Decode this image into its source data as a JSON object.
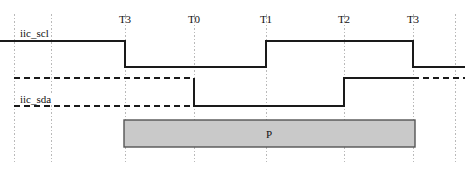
{
  "diagram": {
    "type": "timing-diagram",
    "width": 465,
    "height": 170,
    "background_color": "#ffffff",
    "signal_color": "#1a1a1a",
    "gridline_color": "#b9b9b9",
    "box_fill_color": "#c9c9c9",
    "box_border_color": "#555555",
    "text_color": "#111111"
  },
  "time_markers": [
    {
      "label": "T3",
      "x": 125
    },
    {
      "label": "T0",
      "x": 194
    },
    {
      "label": "T1",
      "x": 266
    },
    {
      "label": "T2",
      "x": 344
    },
    {
      "label": "T3",
      "x": 413
    }
  ],
  "gridlines": [
    {
      "x": 14
    },
    {
      "x": 51
    },
    {
      "x": 125
    },
    {
      "x": 194
    },
    {
      "x": 266
    },
    {
      "x": 344
    },
    {
      "x": 413
    },
    {
      "x": 455
    }
  ],
  "signals": [
    {
      "name": "iic_scl",
      "label": "iic_scl",
      "label_x": 18,
      "label_y": 28,
      "high_y": 41,
      "low_y": 67,
      "points": "0,41 125,41 125,67 266,67 266,41 413,41 413,67 465,67",
      "transitions": [
        {
          "time": "T3",
          "x": 125,
          "edge": "falling"
        },
        {
          "time": "T1",
          "x": 266,
          "edge": "rising"
        },
        {
          "time": "T3",
          "x": 413,
          "edge": "falling"
        }
      ]
    },
    {
      "name": "iic_sda",
      "label": "iic_sda",
      "label_x": 18,
      "label_y": 94,
      "high_y": 78,
      "low_y": 106,
      "points": "194,78 194,106 344,106 344,78 413,78",
      "transitions": [
        {
          "time": "T0",
          "x": 194,
          "edge": "falling"
        },
        {
          "time": "T2",
          "x": 344,
          "edge": "rising"
        }
      ]
    }
  ],
  "reference_lines": [
    {
      "name": "sda-high-reference",
      "y": 78,
      "x1": 14,
      "x2": 194,
      "style": "dashed"
    },
    {
      "name": "sda-low-reference",
      "y": 106,
      "x1": 14,
      "x2": 194,
      "style": "dashed"
    },
    {
      "name": "sda-high-reference-right",
      "y": 78,
      "x1": 413,
      "x2": 465,
      "style": "dashed"
    }
  ],
  "annotation_box": {
    "label": "P",
    "x": 124,
    "y": 120,
    "width": 291,
    "height": 27,
    "center_x": 269,
    "center_y": 134
  }
}
